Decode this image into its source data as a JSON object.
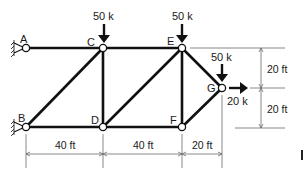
{
  "figure": {
    "type": "planar truss",
    "nodes": [
      {
        "id": "A",
        "label": "A",
        "x_ft": 0,
        "y_ft": 40,
        "support": "pin (wall)"
      },
      {
        "id": "B",
        "label": "B",
        "x_ft": 0,
        "y_ft": 0,
        "support": "pin (wall)"
      },
      {
        "id": "C",
        "label": "C",
        "x_ft": 40,
        "y_ft": 40
      },
      {
        "id": "D",
        "label": "D",
        "x_ft": 40,
        "y_ft": 0
      },
      {
        "id": "E",
        "label": "E",
        "x_ft": 80,
        "y_ft": 40
      },
      {
        "id": "F",
        "label": "F",
        "x_ft": 80,
        "y_ft": 0
      },
      {
        "id": "G",
        "label": "G",
        "x_ft": 100,
        "y_ft": 20
      }
    ],
    "members": [
      "A-C",
      "C-E",
      "B-D",
      "D-F",
      "B-C",
      "C-D",
      "D-E",
      "E-F",
      "E-G",
      "F-G"
    ],
    "loads": [
      {
        "node": "C",
        "label": "50 k",
        "direction": "down"
      },
      {
        "node": "E",
        "label": "50 k",
        "direction": "down"
      },
      {
        "node": "G",
        "label": "50 k",
        "direction": "down"
      },
      {
        "node": "G",
        "label": "20 k",
        "direction": "right"
      }
    ],
    "dimensions": {
      "horizontal": [
        {
          "label": "40 ft",
          "from": "B",
          "to": "D"
        },
        {
          "label": "40 ft",
          "from": "D",
          "to": "F"
        },
        {
          "label": "20 ft",
          "from": "F",
          "to": "G"
        }
      ],
      "vertical": [
        {
          "label": "20 ft",
          "from": "E",
          "to": "G"
        },
        {
          "label": "20 ft",
          "from": "G",
          "to": "F"
        }
      ]
    }
  },
  "labels": {
    "A": "A",
    "B": "B",
    "C": "C",
    "D": "D",
    "E": "E",
    "F": "F",
    "G": "G",
    "load_C": "50 k",
    "load_E": "50 k",
    "load_G_down": "50 k",
    "load_G_right": "20 k",
    "dim_BD": "40 ft",
    "dim_DF": "40 ft",
    "dim_FG": "20 ft",
    "dim_EG": "20 ft",
    "dim_GF": "20 ft"
  }
}
